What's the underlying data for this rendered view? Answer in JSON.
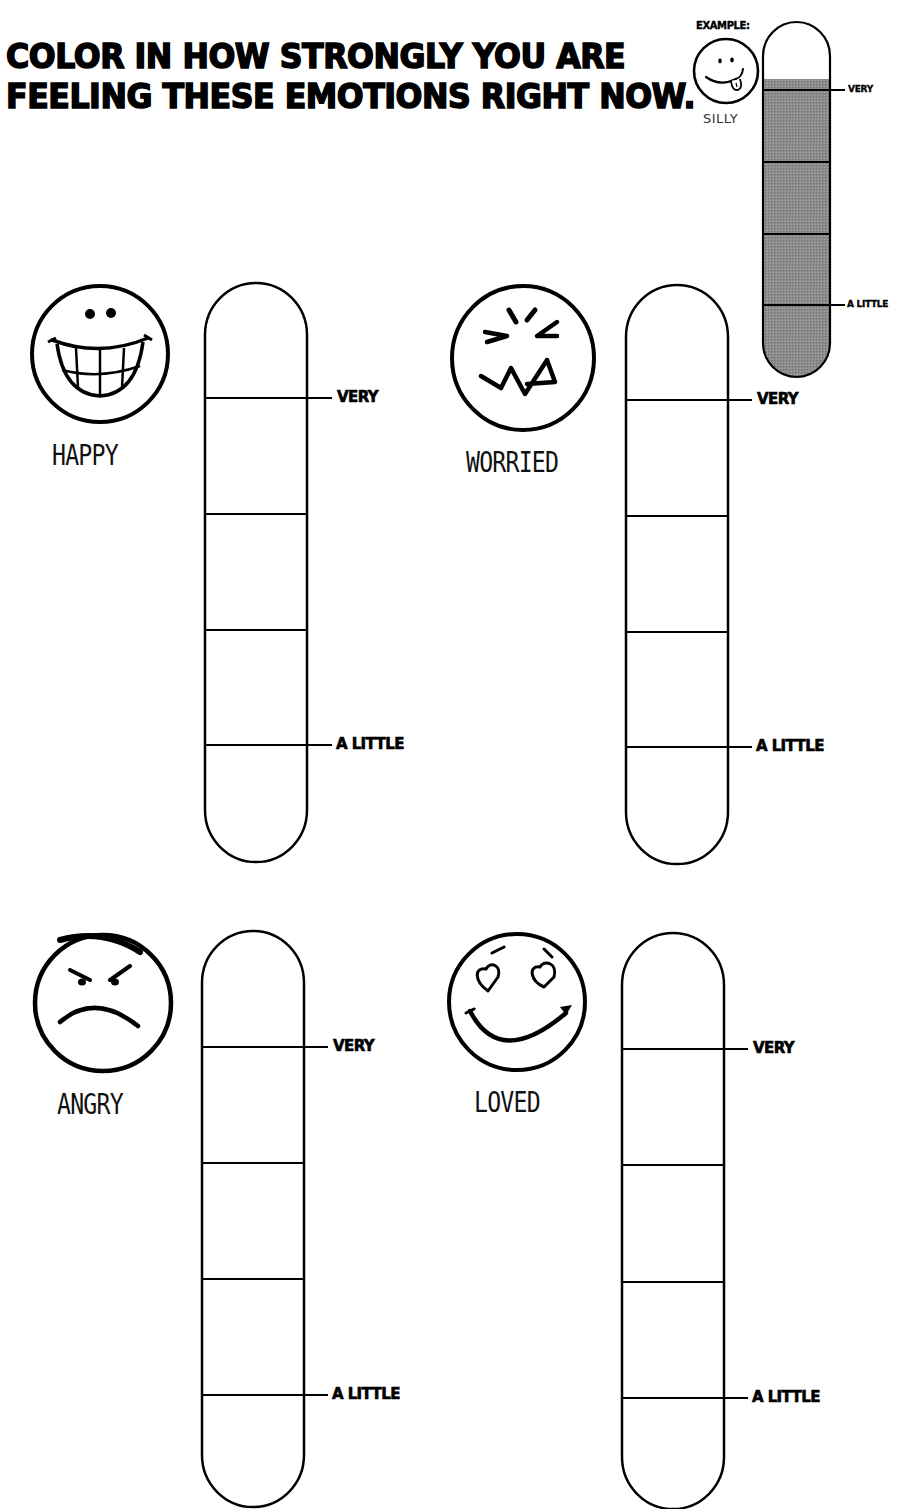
{
  "worksheet": {
    "title_lines": [
      "COLOR IN HOW STRONGLY YOU ARE",
      "FEELING THESE EMOTIONS RIGHT NOW."
    ],
    "example": {
      "label": "EXAMPLE:",
      "emotion": "SILLY",
      "face_icon": "silly-face-icon",
      "fill_level_percent": 85,
      "fill_color": "#8c8c8c",
      "scale_top_label": "VERY",
      "scale_bottom_label": "A LITTLE"
    },
    "scale_labels": {
      "top": "VERY",
      "bottom": "A LITTLE"
    },
    "scale_segments": 4,
    "emotions": [
      {
        "name": "HAPPY",
        "face_icon": "happy-face-icon",
        "fill_level_percent": 0
      },
      {
        "name": "WORRIED",
        "face_icon": "worried-face-icon",
        "fill_level_percent": 0
      },
      {
        "name": "ANGRY",
        "face_icon": "angry-face-icon",
        "fill_level_percent": 0
      },
      {
        "name": "LOVED",
        "face_icon": "loved-face-icon",
        "fill_level_percent": 0
      }
    ],
    "colors": {
      "ink": "#000000",
      "paper": "#ffffff",
      "example_fill": "#8c8c8c"
    }
  }
}
